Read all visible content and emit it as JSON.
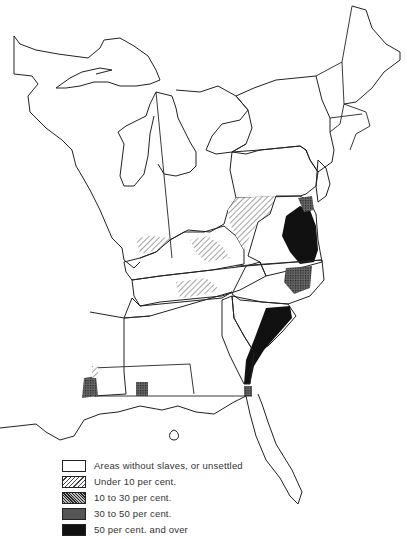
{
  "map": {
    "region": "Eastern United States",
    "background_color": "#ffffff",
    "line_color": "#222222"
  },
  "legend": {
    "items": [
      {
        "key": "none",
        "label": "Areas without slaves, or unsettled",
        "fill": "#ffffff",
        "pattern": "blank"
      },
      {
        "key": "under10",
        "label": "Under 10 per cent.",
        "fill": "#e8e8e8",
        "pattern": "light-diagonal-hatch"
      },
      {
        "key": "10to30",
        "label": "10 to 30 per cent.",
        "fill": "#9a9a9a",
        "pattern": "dense-diagonal-hatch"
      },
      {
        "key": "30to50",
        "label": "30 to 50 per cent.",
        "fill": "#5a5a5a",
        "pattern": "cross-hatch"
      },
      {
        "key": "over50",
        "label": "50 per cent. and over",
        "fill": "#111111",
        "pattern": "solid-black"
      }
    ]
  }
}
